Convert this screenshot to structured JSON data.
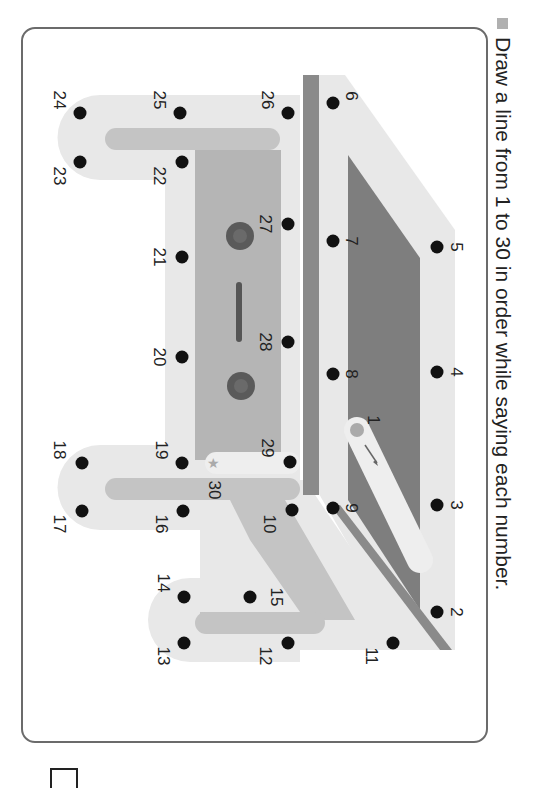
{
  "instruction": {
    "bullet_icon": "gray-square",
    "text": "Draw a line from 1 to 30 in order while saying each number."
  },
  "colors": {
    "light_band": "#e8e8e8",
    "mid_gray": "#c4c4c4",
    "body_gray": "#b3b3b3",
    "dark_gray": "#7e7e7e",
    "stripe": "#8a8a8a",
    "eye": "#5a5a5a",
    "dot": "#111111"
  },
  "dots": [
    {
      "n": "1",
      "x": 357,
      "y": 430,
      "start": true
    },
    {
      "n": "2",
      "x": 437,
      "y": 612
    },
    {
      "n": "3",
      "x": 437,
      "y": 505
    },
    {
      "n": "4",
      "x": 437,
      "y": 372
    },
    {
      "n": "5",
      "x": 437,
      "y": 247
    },
    {
      "n": "6",
      "x": 333,
      "y": 103
    },
    {
      "n": "7",
      "x": 333,
      "y": 241
    },
    {
      "n": "8",
      "x": 333,
      "y": 374
    },
    {
      "n": "9",
      "x": 333,
      "y": 508
    },
    {
      "n": "10",
      "x": 292,
      "y": 510
    },
    {
      "n": "11",
      "x": 393,
      "y": 643
    },
    {
      "n": "12",
      "x": 288,
      "y": 643
    },
    {
      "n": "13",
      "x": 184,
      "y": 643
    },
    {
      "n": "14",
      "x": 184,
      "y": 597
    },
    {
      "n": "15",
      "x": 250,
      "y": 597
    },
    {
      "n": "16",
      "x": 183,
      "y": 511
    },
    {
      "n": "17",
      "x": 82,
      "y": 511
    },
    {
      "n": "18",
      "x": 82,
      "y": 463
    },
    {
      "n": "19",
      "x": 182,
      "y": 463
    },
    {
      "n": "20",
      "x": 182,
      "y": 357
    },
    {
      "n": "21",
      "x": 182,
      "y": 257
    },
    {
      "n": "22",
      "x": 182,
      "y": 162
    },
    {
      "n": "23",
      "x": 80,
      "y": 162
    },
    {
      "n": "24",
      "x": 80,
      "y": 113
    },
    {
      "n": "25",
      "x": 180,
      "y": 113
    },
    {
      "n": "26",
      "x": 288,
      "y": 113
    },
    {
      "n": "27",
      "x": 288,
      "y": 224
    },
    {
      "n": "28",
      "x": 288,
      "y": 342
    },
    {
      "n": "29",
      "x": 290,
      "y": 462
    },
    {
      "n": "30",
      "x": 213,
      "y": 462,
      "end_star": true
    }
  ],
  "labels": [
    {
      "n": "1",
      "x": 372,
      "y": 420
    },
    {
      "n": "2",
      "x": 455,
      "y": 612
    },
    {
      "n": "3",
      "x": 455,
      "y": 505
    },
    {
      "n": "4",
      "x": 455,
      "y": 372
    },
    {
      "n": "5",
      "x": 455,
      "y": 247
    },
    {
      "n": "6",
      "x": 350,
      "y": 96
    },
    {
      "n": "7",
      "x": 350,
      "y": 241
    },
    {
      "n": "8",
      "x": 350,
      "y": 374
    },
    {
      "n": "9",
      "x": 350,
      "y": 508
    },
    {
      "n": "10",
      "x": 268,
      "y": 524
    },
    {
      "n": "11",
      "x": 370,
      "y": 656
    },
    {
      "n": "12",
      "x": 264,
      "y": 656
    },
    {
      "n": "13",
      "x": 162,
      "y": 656
    },
    {
      "n": "14",
      "x": 162,
      "y": 583
    },
    {
      "n": "15",
      "x": 275,
      "y": 597
    },
    {
      "n": "16",
      "x": 160,
      "y": 524
    },
    {
      "n": "17",
      "x": 58,
      "y": 524
    },
    {
      "n": "18",
      "x": 58,
      "y": 450
    },
    {
      "n": "19",
      "x": 160,
      "y": 450
    },
    {
      "n": "20",
      "x": 158,
      "y": 357
    },
    {
      "n": "21",
      "x": 158,
      "y": 257
    },
    {
      "n": "22",
      "x": 158,
      "y": 176
    },
    {
      "n": "23",
      "x": 58,
      "y": 176
    },
    {
      "n": "24",
      "x": 58,
      "y": 100
    },
    {
      "n": "25",
      "x": 158,
      "y": 100
    },
    {
      "n": "26",
      "x": 266,
      "y": 100
    },
    {
      "n": "27",
      "x": 264,
      "y": 224
    },
    {
      "n": "28",
      "x": 264,
      "y": 342
    },
    {
      "n": "29",
      "x": 266,
      "y": 448
    },
    {
      "n": "30",
      "x": 213,
      "y": 490
    }
  ]
}
